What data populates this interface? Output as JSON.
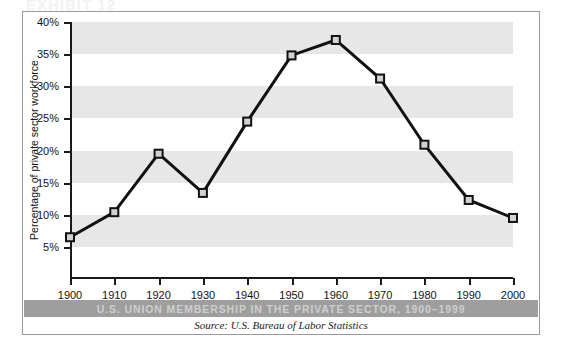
{
  "exhibit_heading": "EXHIBIT 12",
  "caption": "U.S. UNION MEMBERSHIP IN THE PRIVATE SECTOR, 1900–1999",
  "source": "Source: U.S. Bureau of Labor Statistics",
  "colors": {
    "band": "#e7e7e7",
    "line": "#111111",
    "marker_fill": "#d2d2d2",
    "caption_bar": "#9e9e9e",
    "caption_text": "#cfcfcf",
    "frame": "#9a9a9a"
  },
  "chart_data": {
    "type": "line",
    "title": "U.S. UNION MEMBERSHIP IN THE PRIVATE SECTOR, 1900–1999",
    "xlabel": "",
    "ylabel": "Percentage of private sector workforce",
    "x": [
      1900,
      1910,
      1920,
      1930,
      1940,
      1950,
      1960,
      1970,
      1980,
      1990,
      2000
    ],
    "xticklabels": [
      "1900",
      "1910",
      "1920",
      "1930",
      "1940",
      "1950",
      "1960",
      "1970",
      "1980",
      "1990",
      "2000"
    ],
    "values": [
      6.5,
      10.4,
      19.5,
      13.4,
      24.5,
      34.8,
      37.2,
      31.2,
      20.9,
      12.3,
      9.5
    ],
    "yticks": [
      5,
      10,
      15,
      20,
      25,
      30,
      35,
      40
    ],
    "yticklabels": [
      "5%",
      "10%",
      "15%",
      "20%",
      "25%",
      "30%",
      "35%",
      "40%"
    ],
    "ylim": [
      0,
      40
    ],
    "xlim": [
      1900,
      2000
    ],
    "grid": false,
    "banded_background": true,
    "legend": null,
    "marker": "square",
    "series_name": "Private sector union membership"
  }
}
